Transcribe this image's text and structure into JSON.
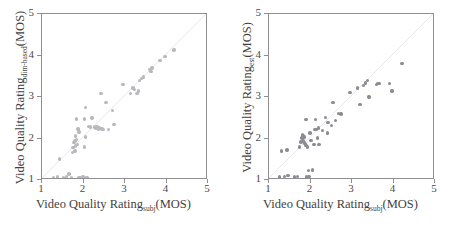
{
  "figure": {
    "background": "#ffffff",
    "frame_color": "#8f8f92",
    "diagonal_color": "#d8d8dc",
    "width": 454,
    "height": 236
  },
  "panels": [
    {
      "id": "left",
      "xlabel_main": "Video Quality Rating",
      "xlabel_sub": "subj",
      "xlabel_tail": "(MOS)",
      "ylabel_main": "Video Quality Rating",
      "ylabel_sub": "dim-based",
      "ylabel_tail": "(MOS)",
      "marker_color": "#b9b9bd"
    },
    {
      "id": "right",
      "xlabel_main": "Video Quality Rating",
      "xlabel_sub": "subj",
      "xlabel_tail": "(MOS)",
      "ylabel_main": "Video Quality Rating",
      "ylabel_sub": "est",
      "ylabel_tail": "(MOS)",
      "marker_color": "#8b8b92"
    }
  ],
  "chart_data": [
    {
      "type": "scatter",
      "panel": "left",
      "title": "",
      "xlabel": "Video Quality Rating_subj (MOS)",
      "ylabel": "Video Quality Rating_dim-based (MOS)",
      "xlim": [
        1,
        5
      ],
      "ylim": [
        1,
        5
      ],
      "xticks": [
        1,
        2,
        3,
        4,
        5
      ],
      "yticks": [
        1,
        2,
        3,
        4,
        5
      ],
      "grid": false,
      "legend": null,
      "reference_line": {
        "type": "identity",
        "from": [
          1,
          1
        ],
        "to": [
          5,
          5
        ],
        "color": "#d8d8dc"
      },
      "marker_color": "#b9b9bd",
      "points": [
        [
          1.28,
          1.01
        ],
        [
          1.38,
          1.02
        ],
        [
          1.42,
          1.46
        ],
        [
          1.52,
          1.01
        ],
        [
          1.6,
          1.02
        ],
        [
          1.66,
          1.1
        ],
        [
          1.72,
          1.01
        ],
        [
          1.74,
          1.62
        ],
        [
          1.76,
          1.74
        ],
        [
          1.78,
          1.86
        ],
        [
          1.8,
          1.66
        ],
        [
          1.8,
          1.9
        ],
        [
          1.82,
          1.78
        ],
        [
          1.82,
          2.02
        ],
        [
          1.84,
          1.94
        ],
        [
          1.84,
          2.44
        ],
        [
          1.86,
          1.82
        ],
        [
          1.88,
          2.2
        ],
        [
          1.9,
          2.12
        ],
        [
          1.9,
          1.01
        ],
        [
          1.94,
          1.01
        ],
        [
          1.98,
          1.01
        ],
        [
          2.0,
          1.02
        ],
        [
          2.02,
          1.01
        ],
        [
          2.04,
          1.76
        ],
        [
          2.04,
          2.44
        ],
        [
          2.06,
          2.72
        ],
        [
          2.06,
          2.0
        ],
        [
          2.1,
          1.01
        ],
        [
          2.14,
          2.26
        ],
        [
          2.18,
          2.24
        ],
        [
          2.22,
          2.46
        ],
        [
          2.28,
          2.24
        ],
        [
          2.32,
          2.22
        ],
        [
          2.34,
          2.24
        ],
        [
          2.38,
          2.18
        ],
        [
          2.4,
          2.22
        ],
        [
          2.44,
          3.06
        ],
        [
          2.46,
          2.2
        ],
        [
          2.5,
          2.18
        ],
        [
          2.56,
          2.84
        ],
        [
          2.62,
          2.18
        ],
        [
          2.72,
          2.64
        ],
        [
          2.76,
          2.3
        ],
        [
          2.98,
          3.28
        ],
        [
          3.16,
          3.06
        ],
        [
          3.22,
          3.2
        ],
        [
          3.26,
          3.16
        ],
        [
          3.32,
          3.06
        ],
        [
          3.36,
          3.12
        ],
        [
          3.38,
          3.38
        ],
        [
          3.42,
          3.42
        ],
        [
          3.48,
          3.46
        ],
        [
          3.62,
          3.64
        ],
        [
          3.66,
          3.6
        ],
        [
          3.68,
          3.68
        ],
        [
          3.88,
          3.86
        ],
        [
          4.0,
          3.96
        ],
        [
          4.22,
          4.12
        ]
      ]
    },
    {
      "type": "scatter",
      "panel": "right",
      "title": "",
      "xlabel": "Video Quality Rating_subj (MOS)",
      "ylabel": "Video Quality Rating_est (MOS)",
      "xlim": [
        1,
        5
      ],
      "ylim": [
        1,
        5
      ],
      "xticks": [
        1,
        2,
        3,
        4,
        5
      ],
      "yticks": [
        1,
        2,
        3,
        4,
        5
      ],
      "grid": false,
      "legend": null,
      "reference_line": {
        "type": "identity",
        "from": [
          1,
          1
        ],
        "to": [
          5,
          5
        ],
        "color": "#d8d8dc"
      },
      "marker_color": "#8b8b92",
      "points": [
        [
          1.26,
          1.02
        ],
        [
          1.3,
          1.66
        ],
        [
          1.38,
          1.04
        ],
        [
          1.44,
          1.68
        ],
        [
          1.46,
          1.06
        ],
        [
          1.62,
          1.02
        ],
        [
          1.7,
          1.04
        ],
        [
          1.74,
          1.76
        ],
        [
          1.78,
          1.88
        ],
        [
          1.8,
          1.98
        ],
        [
          1.82,
          2.02
        ],
        [
          1.82,
          2.06
        ],
        [
          1.84,
          2.04
        ],
        [
          1.84,
          1.92
        ],
        [
          1.86,
          2.0
        ],
        [
          1.86,
          1.86
        ],
        [
          1.88,
          1.84
        ],
        [
          1.9,
          1.8
        ],
        [
          1.9,
          2.42
        ],
        [
          1.92,
          1.02
        ],
        [
          1.94,
          1.76
        ],
        [
          1.96,
          1.18
        ],
        [
          1.98,
          1.04
        ],
        [
          2.0,
          2.1
        ],
        [
          2.02,
          1.92
        ],
        [
          2.06,
          1.2
        ],
        [
          2.1,
          1.82
        ],
        [
          2.12,
          2.18
        ],
        [
          2.14,
          2.42
        ],
        [
          2.16,
          2.18
        ],
        [
          2.18,
          1.98
        ],
        [
          2.2,
          2.22
        ],
        [
          2.22,
          1.82
        ],
        [
          2.3,
          2.16
        ],
        [
          2.38,
          2.48
        ],
        [
          2.42,
          2.1
        ],
        [
          2.44,
          2.36
        ],
        [
          2.52,
          2.28
        ],
        [
          2.56,
          2.84
        ],
        [
          2.62,
          2.4
        ],
        [
          2.7,
          2.58
        ],
        [
          2.76,
          2.56
        ],
        [
          2.98,
          3.08
        ],
        [
          3.16,
          3.2
        ],
        [
          3.22,
          2.8
        ],
        [
          3.3,
          3.26
        ],
        [
          3.36,
          3.32
        ],
        [
          3.4,
          3.38
        ],
        [
          3.44,
          2.98
        ],
        [
          3.62,
          3.28
        ],
        [
          3.66,
          3.3
        ],
        [
          3.7,
          3.3
        ],
        [
          3.94,
          3.3
        ],
        [
          4.0,
          3.12
        ],
        [
          4.24,
          3.8
        ]
      ]
    }
  ]
}
